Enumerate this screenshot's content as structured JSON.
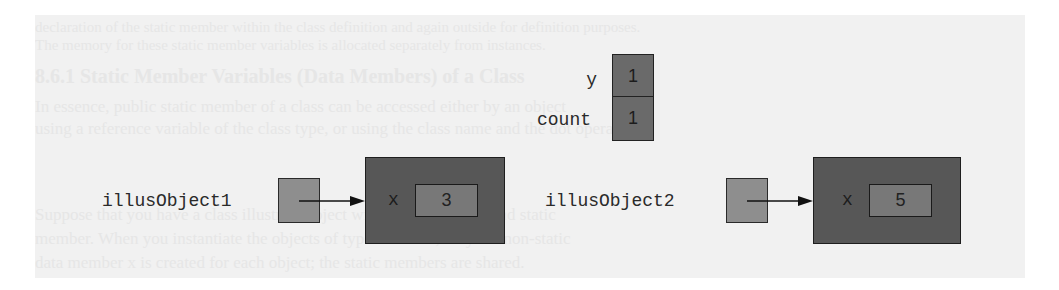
{
  "background_text": {
    "lines": [
      "declaration of the static member within the class definition and again outside for definition purposes.",
      "The memory for these static member variables is allocated separately from instances.",
      "    8.6.1 Static Member Variables (Data Members) of a Class",
      "In essence, public static member of a class can be accessed either by an object",
      "using a reference variable of the class type, or using the class name and the dot operator.",
      "Suppose that you have a class illustrate object with data member x and static",
      "member. When you instantiate the objects of type illustrate, only the non-static",
      "data member x is created for each object; the static members are shared."
    ]
  },
  "static_members": {
    "cells": [
      {
        "name": "y",
        "value": "1"
      },
      {
        "name": "count",
        "value": "1"
      }
    ]
  },
  "objects": [
    {
      "reference_name": "illusObject1",
      "field_name": "x",
      "field_value": "3"
    },
    {
      "reference_name": "illusObject2",
      "field_name": "x",
      "field_value": "5"
    }
  ],
  "colors": {
    "panel_bg": "#f1f1f1",
    "static_cell_fill": "#6a6a6a",
    "reference_fill": "#8e8e8e",
    "object_fill": "#575757",
    "field_fill": "#787878",
    "text": "#2a2a2a"
  }
}
